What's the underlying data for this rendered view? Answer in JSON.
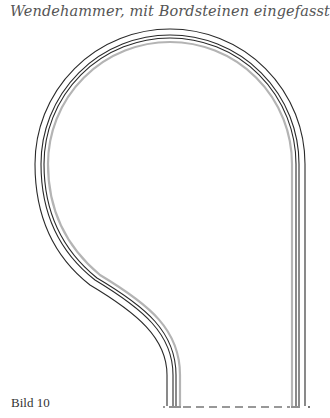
{
  "title": "Wendehammer, mit Bordsteinen eingefasst",
  "caption": "Bild 10",
  "diagram": {
    "type": "turning-head plan (Wendehammer) with curb edging",
    "lines": [
      {
        "name": "outer-edge",
        "color": "#2a2a2a"
      },
      {
        "name": "curb-outer",
        "color": "#2a2a2a"
      },
      {
        "name": "curb-inner",
        "color": "#2a2a2a"
      },
      {
        "name": "gutter",
        "color": "#b0b0b0"
      }
    ],
    "bottom_boundary": "dashed"
  }
}
